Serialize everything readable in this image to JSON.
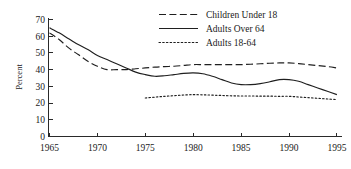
{
  "chart_data": {
    "type": "line",
    "title": "",
    "subtitle": "",
    "xlabel": "",
    "ylabel": "Percent",
    "xlim": [
      1965,
      1995
    ],
    "ylim": [
      0,
      70
    ],
    "grid": false,
    "legend_position": "top-right",
    "x_ticks": [
      "1965",
      "1970",
      "1975",
      "1980",
      "1985",
      "1990",
      "1995"
    ],
    "y_ticks": [
      "0",
      "10",
      "20",
      "30",
      "40",
      "50",
      "60",
      "70"
    ],
    "series": [
      {
        "name": "Children Under 18",
        "style": "dashed",
        "x": [
          1965,
          1966,
          1967,
          1968,
          1969,
          1970,
          1971,
          1972,
          1973,
          1974,
          1975,
          1976,
          1977,
          1978,
          1979,
          1980,
          1981,
          1982,
          1983,
          1984,
          1985,
          1986,
          1987,
          1988,
          1989,
          1990,
          1991,
          1992,
          1993,
          1994,
          1995
        ],
        "values": [
          62,
          58,
          53,
          49,
          45,
          42,
          40,
          40,
          40,
          40.5,
          41,
          41.5,
          41.8,
          42,
          42.5,
          43,
          43,
          43,
          43,
          43,
          43,
          43.2,
          43.5,
          43.8,
          44,
          44,
          43.6,
          43,
          42.4,
          41.8,
          41
        ]
      },
      {
        "name": "Adults Over 64",
        "style": "solid",
        "x": [
          1965,
          1966,
          1967,
          1968,
          1969,
          1970,
          1971,
          1972,
          1973,
          1974,
          1975,
          1976,
          1977,
          1978,
          1979,
          1980,
          1981,
          1982,
          1983,
          1984,
          1985,
          1986,
          1987,
          1988,
          1989,
          1990,
          1991,
          1992,
          1993,
          1994,
          1995
        ],
        "values": [
          65,
          62,
          58.5,
          55,
          52,
          48.5,
          46,
          43.5,
          41,
          38.5,
          37,
          36,
          36.3,
          37,
          37.7,
          38,
          37.5,
          36,
          34,
          32,
          31,
          31,
          31.6,
          32.7,
          34,
          34,
          33,
          31,
          29,
          27,
          25
        ]
      },
      {
        "name": "Adults 18-64",
        "style": "dotted",
        "x": [
          1975,
          1976,
          1977,
          1978,
          1979,
          1980,
          1981,
          1982,
          1983,
          1984,
          1985,
          1986,
          1987,
          1988,
          1989,
          1990,
          1991,
          1992,
          1993,
          1994,
          1995
        ],
        "values": [
          23,
          23.5,
          24,
          24.4,
          24.8,
          25,
          24.9,
          24.7,
          24.5,
          24.3,
          24.2,
          24.2,
          24.1,
          24.1,
          24,
          24,
          23.6,
          23.2,
          22.8,
          22.4,
          22
        ]
      }
    ]
  },
  "legend": {
    "items": [
      {
        "label": "Children Under 18"
      },
      {
        "label": "Adults Over 64"
      },
      {
        "label": "Adults 18-64"
      }
    ]
  },
  "axes": {
    "y_title": "Percent"
  }
}
